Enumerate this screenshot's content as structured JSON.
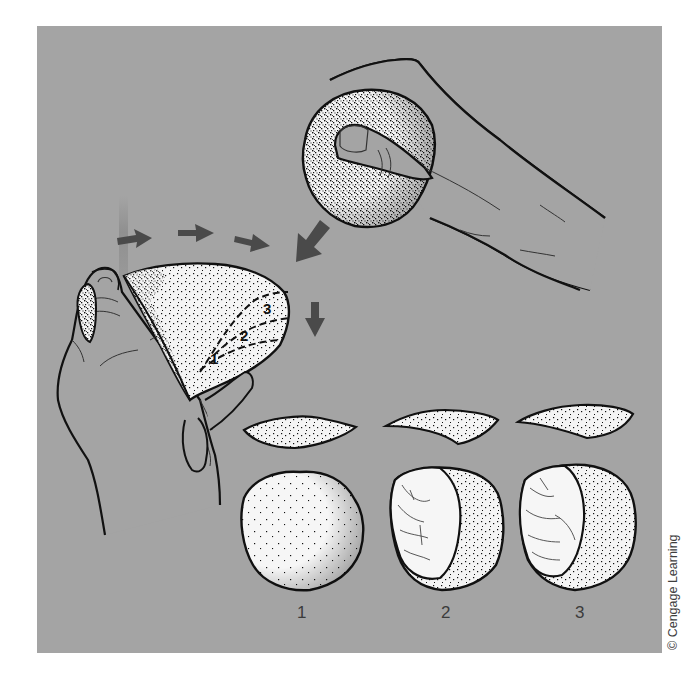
{
  "figure": {
    "colors": {
      "background": "#a4a4a4",
      "page": "#ffffff",
      "arrow": "#4a4a4a",
      "outline": "#111111",
      "stone_fill": "#f4f4f4",
      "skin": "#a4a4a4"
    },
    "elements": {
      "hammer_hand": "hand-holding-hammerstone",
      "core_hand": "hand-holding-core",
      "arrows": [
        "arrow-right-1",
        "arrow-right-2",
        "arrow-right-3",
        "arrow-down-left",
        "arrow-down"
      ],
      "core_flake_scars": [
        "1",
        "2",
        "3"
      ]
    },
    "stages": [
      {
        "label": "1",
        "flake": "flake-1",
        "core": "core-unflaked"
      },
      {
        "label": "2",
        "flake": "flake-2",
        "core": "core-one-scar"
      },
      {
        "label": "3",
        "flake": "flake-3",
        "core": "core-two-scars"
      }
    ],
    "copyright": "© Cengage Learning"
  }
}
